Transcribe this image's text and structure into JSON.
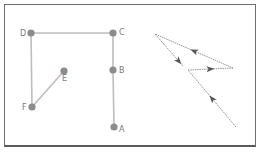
{
  "colors": {
    "frame": "#6e6e6e",
    "edge": "#bdbdbd",
    "node": "#8c8c8c",
    "label": "#7a7a7a",
    "path": "#8a8a8a",
    "arrow": "#555555"
  },
  "graph": {
    "nodes": [
      {
        "id": "A",
        "label": "A",
        "x": 114,
        "y": 127
      },
      {
        "id": "B",
        "label": "B",
        "x": 113,
        "y": 70
      },
      {
        "id": "C",
        "label": "C",
        "x": 113,
        "y": 33
      },
      {
        "id": "D",
        "label": "D",
        "x": 31,
        "y": 33
      },
      {
        "id": "E",
        "label": "E",
        "x": 64,
        "y": 71
      },
      {
        "id": "F",
        "label": "F",
        "x": 32,
        "y": 107
      }
    ],
    "edges": [
      [
        "A",
        "B"
      ],
      [
        "B",
        "C"
      ],
      [
        "C",
        "D"
      ],
      [
        "D",
        "F"
      ],
      [
        "F",
        "E"
      ]
    ]
  },
  "directed_path": {
    "points": [
      {
        "x": 236,
        "y": 127
      },
      {
        "x": 188,
        "y": 70
      },
      {
        "x": 233,
        "y": 68
      },
      {
        "x": 155,
        "y": 34
      },
      {
        "x": 183,
        "y": 66
      }
    ],
    "arrow_count": 4
  }
}
